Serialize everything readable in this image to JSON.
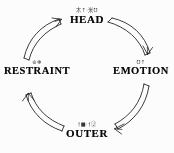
{
  "diagram": {
    "direction": "clockwise",
    "background_color": "#fefefe",
    "ink_color": "#111111",
    "nodes": [
      {
        "id": "head",
        "label": "HEAD",
        "sub": "木↑·米℧"
      },
      {
        "id": "emotion",
        "label": "EMOTION",
        "sub": "℧↑"
      },
      {
        "id": "outer",
        "label": "OUTER",
        "sub": "†■·†Ⓙ"
      },
      {
        "id": "restraint",
        "label": "RESTRAINT",
        "sub": "⊚✻"
      }
    ],
    "arrows": [
      {
        "id": "head-to-emotion",
        "from": "HEAD",
        "to": "EMOTION"
      },
      {
        "id": "emotion-to-outer",
        "from": "EMOTION",
        "to": "OUTER"
      },
      {
        "id": "outer-to-restraint",
        "from": "OUTER",
        "to": "RESTRAINT"
      },
      {
        "id": "restraint-to-head",
        "from": "RESTRAINT",
        "to": "HEAD"
      }
    ]
  }
}
